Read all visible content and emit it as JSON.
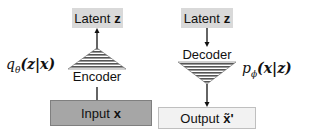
{
  "encoder_side": {
    "top_box": {
      "label": "Latent",
      "symbol": "z"
    },
    "model_label": "Encoder",
    "distribution": {
      "func": "q",
      "subscript": "θ",
      "args": "(z|x)"
    },
    "bottom_box": {
      "label": "Input",
      "symbol": "x"
    }
  },
  "decoder_side": {
    "top_box": {
      "label": "Latent",
      "symbol": "z"
    },
    "model_label": "Decoder",
    "distribution": {
      "func": "p",
      "subscript": "ϕ",
      "args": "(x|z)"
    },
    "bottom_box": {
      "label": "Output",
      "symbol": "x̃'"
    }
  },
  "colors": {
    "latent_fill": "#d9d9d9",
    "input_fill": "#a6a6a6",
    "output_fill": "#f2f2f2",
    "stripes": "#555555"
  }
}
